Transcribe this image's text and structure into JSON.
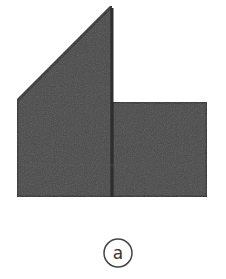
{
  "figure": {
    "label": "a",
    "colors": {
      "fill": "#4a4a4a",
      "stroke": "#333333",
      "divider": "#2e2e2e",
      "label_circle": "#444444",
      "background": "#ffffff"
    },
    "shapes": {
      "left_piece": {
        "description": "trapezoid with slanted top (triangle on top of square)",
        "points": [
          [
            17,
            101
          ],
          [
            112,
            6
          ],
          [
            112,
            197
          ],
          [
            17,
            197
          ]
        ]
      },
      "right_piece": {
        "description": "rectangle",
        "points": [
          [
            112,
            102
          ],
          [
            207,
            102
          ],
          [
            207,
            197
          ],
          [
            112,
            197
          ]
        ]
      }
    },
    "label_circle": {
      "cx": 118,
      "cy": 253,
      "r": 14
    }
  }
}
